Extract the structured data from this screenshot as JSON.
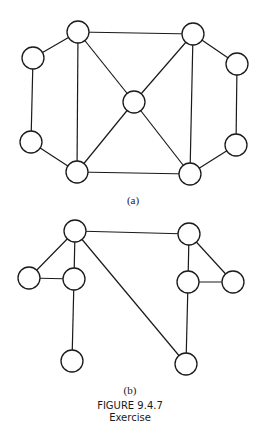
{
  "figure": {
    "title": "FIGURE 9.4.7",
    "subtitle": "Exercise"
  },
  "graphs": [
    {
      "label": "(a)",
      "node_radius": 11,
      "nodes": [
        {
          "id": "tl",
          "x": 78,
          "y": 32
        },
        {
          "id": "l",
          "x": 33,
          "y": 58
        },
        {
          "id": "lb",
          "x": 31,
          "y": 142
        },
        {
          "id": "bl",
          "x": 77,
          "y": 172
        },
        {
          "id": "c",
          "x": 134,
          "y": 102
        },
        {
          "id": "tr",
          "x": 193,
          "y": 34
        },
        {
          "id": "r",
          "x": 237,
          "y": 64
        },
        {
          "id": "rb",
          "x": 236,
          "y": 145
        },
        {
          "id": "br",
          "x": 190,
          "y": 174
        }
      ],
      "edges": [
        [
          "tl",
          "l"
        ],
        [
          "tl",
          "tr"
        ],
        [
          "tl",
          "bl"
        ],
        [
          "tl",
          "c"
        ],
        [
          "l",
          "lb"
        ],
        [
          "lb",
          "bl"
        ],
        [
          "bl",
          "c"
        ],
        [
          "bl",
          "br"
        ],
        [
          "tr",
          "c"
        ],
        [
          "tr",
          "br"
        ],
        [
          "tr",
          "r"
        ],
        [
          "r",
          "rb"
        ],
        [
          "rb",
          "br"
        ],
        [
          "c",
          "br"
        ]
      ]
    },
    {
      "label": "(b)",
      "node_radius": 11,
      "nodes": [
        {
          "id": "t",
          "x": 75,
          "y": 231
        },
        {
          "id": "l",
          "x": 29,
          "y": 278
        },
        {
          "id": "m",
          "x": 74,
          "y": 279
        },
        {
          "id": "bl",
          "x": 72,
          "y": 361
        },
        {
          "id": "tr",
          "x": 189,
          "y": 234
        },
        {
          "id": "mr",
          "x": 188,
          "y": 282
        },
        {
          "id": "fr",
          "x": 233,
          "y": 282
        },
        {
          "id": "br",
          "x": 186,
          "y": 364
        }
      ],
      "edges": [
        [
          "t",
          "l"
        ],
        [
          "t",
          "m"
        ],
        [
          "t",
          "tr"
        ],
        [
          "t",
          "br"
        ],
        [
          "l",
          "m"
        ],
        [
          "m",
          "bl"
        ],
        [
          "tr",
          "mr"
        ],
        [
          "tr",
          "fr"
        ],
        [
          "mr",
          "fr"
        ],
        [
          "mr",
          "br"
        ]
      ]
    }
  ]
}
